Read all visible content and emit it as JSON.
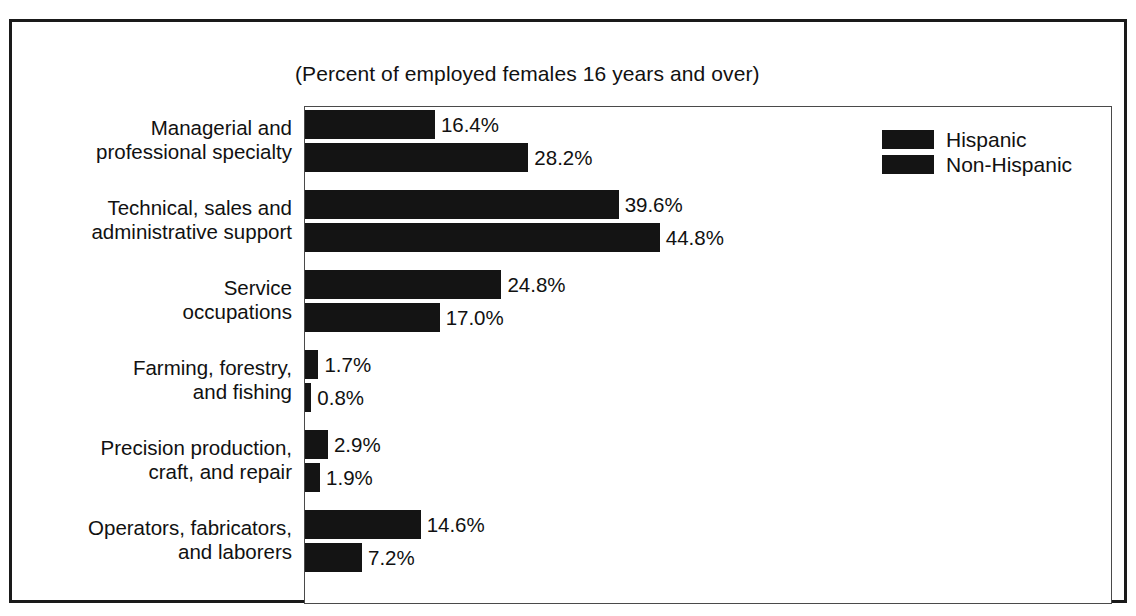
{
  "chart_data": {
    "type": "bar",
    "orientation": "horizontal",
    "title": "",
    "subtitle": "(Percent of employed females 16 years and over)",
    "xlabel": "",
    "ylabel": "",
    "xlim": [
      0,
      102
    ],
    "grid": false,
    "legend_position": "top-right",
    "value_suffix": "%",
    "categories": [
      "Managerial and\nprofessional specialty",
      "Technical, sales and\nadministrative support",
      "Service\noccupations",
      "Farming, forestry,\nand fishing",
      "Precision production,\ncraft, and repair",
      "Operators, fabricators,\nand laborers"
    ],
    "series": [
      {
        "name": "Hispanic",
        "color": "#141414",
        "values": [
          16.4,
          39.6,
          24.8,
          1.7,
          2.9,
          14.6
        ],
        "labels": [
          "16.4%",
          "39.6%",
          "24.8%",
          "1.7%",
          "2.9%",
          "14.6%"
        ]
      },
      {
        "name": "Non-Hispanic",
        "color": "#141414",
        "values": [
          28.2,
          44.8,
          17.0,
          0.8,
          1.9,
          7.2
        ],
        "labels": [
          "28.2%",
          "44.8%",
          "17.0%",
          "0.8%",
          "1.9%",
          "7.2%"
        ]
      }
    ]
  },
  "categories": [
    {
      "line1": "Managerial and",
      "line2": "professional specialty"
    },
    {
      "line1": "Technical, sales and",
      "line2": "administrative support"
    },
    {
      "line1": "Service",
      "line2": "occupations"
    },
    {
      "line1": "Farming, forestry,",
      "line2": "and fishing"
    },
    {
      "line1": "Precision production,",
      "line2": "craft, and repair"
    },
    {
      "line1": "Operators, fabricators,",
      "line2": "and laborers"
    }
  ],
  "legend": {
    "items": [
      {
        "label": "Hispanic",
        "color": "#141414"
      },
      {
        "label": "Non-Hispanic",
        "color": "#141414"
      }
    ]
  }
}
